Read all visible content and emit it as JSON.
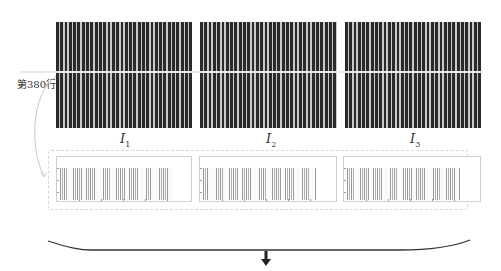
{
  "figure": {
    "row_label": "第380行",
    "images": [
      {
        "id": "I1",
        "label_main": "I",
        "label_sub": "1"
      },
      {
        "id": "I2",
        "label_main": "I",
        "label_sub": "2"
      },
      {
        "id": "I3",
        "label_main": "I",
        "label_sub": "3"
      }
    ],
    "plots": [
      {
        "name": "row-profile-1",
        "description": "intensity profile of row 380 of I1"
      },
      {
        "name": "row-profile-2",
        "description": "intensity profile of row 380 of I2"
      },
      {
        "name": "row-profile-3",
        "description": "intensity profile of row 380 of I3"
      }
    ],
    "colors": {
      "stripe_dark": "#2a2a2a",
      "stripe_light": "#c9c9c9",
      "plot_line": "#9a9a9a",
      "brace": "#333333",
      "arrow": "#222222"
    },
    "icons": {
      "down-arrow": "⬇"
    }
  }
}
